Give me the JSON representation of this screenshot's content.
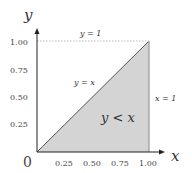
{
  "diagram": {
    "axis_x_label": "x",
    "axis_y_label": "y",
    "origin_label": "0",
    "x_ticks": [
      "0.25",
      "0.50",
      "0.75",
      "1.00"
    ],
    "y_ticks": [
      "0.25",
      "0.50",
      "0.75",
      "1.00"
    ],
    "line_y_eq_1": "y = 1",
    "line_y_eq_x": "y = x",
    "line_x_eq_1": "x = 1",
    "region_label": "y < x",
    "colors": {
      "region_fill": "#d4d4d4",
      "axis": "#222222",
      "dotted_line": "#bbbbbb"
    }
  }
}
